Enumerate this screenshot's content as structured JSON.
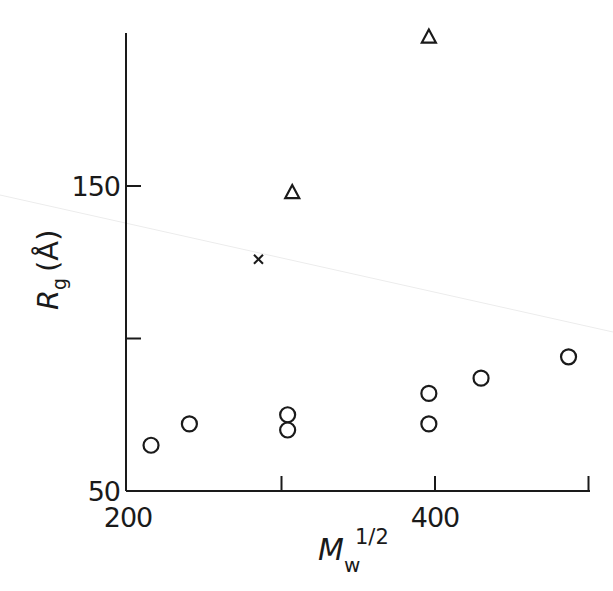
{
  "chart_data": {
    "type": "scatter",
    "title": "",
    "xlabel": "M_w^1/2",
    "ylabel": "R_g (Å)",
    "xlabel_parts": {
      "main": "M",
      "sub": "w",
      "sup": "1/2"
    },
    "ylabel_parts": {
      "main": "R",
      "sub": "g",
      "unit": "(Å)"
    },
    "xlim": [
      200,
      500
    ],
    "ylim": [
      50,
      200
    ],
    "x_ticks": [
      200,
      300,
      400,
      500
    ],
    "x_tick_labels": [
      "200",
      "",
      "400",
      ""
    ],
    "y_ticks": [
      50,
      100,
      150
    ],
    "y_tick_labels": [
      "50",
      "",
      "150"
    ],
    "grid": false,
    "legend": null,
    "series": [
      {
        "name": "circles",
        "marker": "circle",
        "points": [
          {
            "x": 215,
            "y": 65
          },
          {
            "x": 240,
            "y": 72
          },
          {
            "x": 304,
            "y": 75
          },
          {
            "x": 304,
            "y": 70
          },
          {
            "x": 396,
            "y": 82
          },
          {
            "x": 396,
            "y": 72
          },
          {
            "x": 430,
            "y": 87
          },
          {
            "x": 487,
            "y": 94
          }
        ]
      },
      {
        "name": "triangles",
        "marker": "triangle",
        "points": [
          {
            "x": 307,
            "y": 148
          },
          {
            "x": 396,
            "y": 199
          }
        ]
      },
      {
        "name": "crosses",
        "marker": "cross",
        "points": [
          {
            "x": 285,
            "y": 126
          }
        ]
      }
    ]
  }
}
